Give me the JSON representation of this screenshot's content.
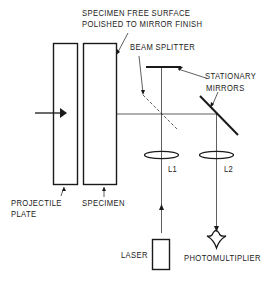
{
  "labels": {
    "specimen_surface_line1": "SPECIMEN FREE SURFACE",
    "specimen_surface_line2": "POLISHED TO MIRROR FINISH",
    "beam_splitter": "BEAM SPLITTER",
    "stationary_mirrors_line1": "STATIONARY",
    "stationary_mirrors_line2": "MIRRORS",
    "lens1": "L1",
    "lens2": "L2",
    "projectile_plate_line1": "PROJECTILE",
    "projectile_plate_line2": "PLATE",
    "specimen": "SPECIMEN",
    "laser": "LASER",
    "photomultiplier": "PHOTOMULTIPLIER"
  },
  "colors": {
    "ink": "#1a1a1a",
    "background": "#ffffff"
  }
}
